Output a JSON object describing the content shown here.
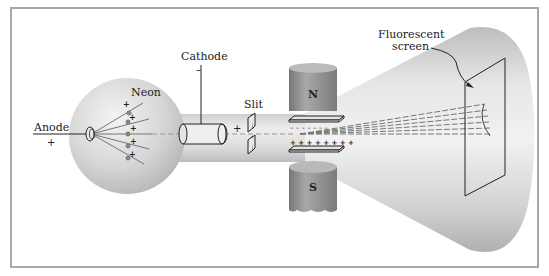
{
  "diagram": {
    "type": "cathode-ray tube with magnetic and electric deflection (positive-ray / mass spectrometer apparatus)",
    "labels": {
      "anode": "Anode",
      "anode_sign": "+",
      "neon": "Neon",
      "cathode": "Cathode",
      "cathode_sign": "–",
      "slit": "Slit",
      "slit_sign": "+",
      "north_pole": "N",
      "south_pole": "S",
      "screen_line1": "Fluorescent",
      "screen_line2": "screen"
    },
    "plate_charges": {
      "upper_plate": "– – – – – – –",
      "lower_plate": "+ + + + + + + +"
    },
    "ion_charges": [
      "+",
      "+",
      "+",
      "+",
      "+"
    ],
    "colors": {
      "frame": "#a8a8a8",
      "glass": "#d9d9d9",
      "glass_highlight": "#f4f4f4",
      "magnet": "#8c8c8c",
      "line": "#222222",
      "background": "#ffffff"
    }
  }
}
